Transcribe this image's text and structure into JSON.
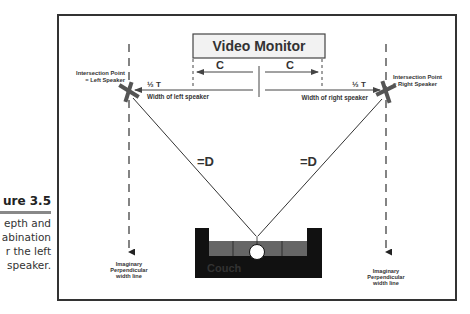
{
  "caption": {
    "figure_label": "Figure 3.5",
    "lines": [
      "Depth and",
      "combination",
      "for the left",
      "speaker."
    ],
    "visible_lines": [
      "epth and",
      "abination",
      "r the left",
      "speaker."
    ],
    "visible_label": "ure 3.5"
  },
  "diagram": {
    "monitor_label": "Video Monitor",
    "c_left": "C",
    "c_right": "C",
    "half_t_left": "½ T",
    "half_t_right": "½ T",
    "width_left": "Width of left speaker",
    "width_right": "Width of right speaker",
    "intersection_left_1": "Intersection Point",
    "intersection_left_2": "= Left Speaker",
    "intersection_right_1": "Intersection Point",
    "intersection_right_2": "= Right Speaker",
    "d_left": "=D",
    "d_right": "=D",
    "couch_label": "Couch",
    "perp_left": [
      "Imaginary",
      "Perpendicular",
      "width line"
    ],
    "perp_right": [
      "Imaginary",
      "Perpendicular",
      "width line"
    ]
  },
  "colors": {
    "frame": "#333333",
    "speaker_x": "#555555",
    "couch_body": "#111111",
    "couch_cushion": "#666666",
    "monitor_fill": "#f2f2f2"
  }
}
